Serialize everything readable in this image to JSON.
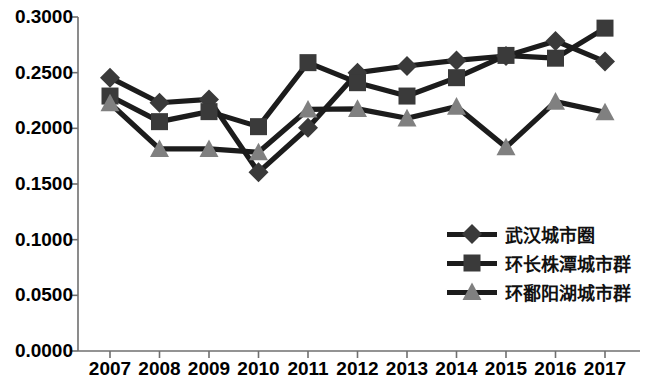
{
  "chart_data": {
    "type": "line",
    "title": "",
    "xlabel": "",
    "ylabel": "",
    "categories": [
      "2007",
      "2008",
      "2009",
      "2010",
      "2011",
      "2012",
      "2013",
      "2014",
      "2015",
      "2016",
      "2017"
    ],
    "ylim": [
      0.0,
      0.3
    ],
    "ytick_labels": [
      "0.0000",
      "0.0500",
      "0.1000",
      "0.1500",
      "0.2000",
      "0.2500",
      "0.3000"
    ],
    "ytick_values": [
      0.0,
      0.05,
      0.1,
      0.15,
      0.2,
      0.25,
      0.3
    ],
    "grid": false,
    "legend_position": "inside-right",
    "series": [
      {
        "name": "武汉城市圈",
        "marker": "diamond",
        "color": "#3a3a3a",
        "line_color": "#1c1c1c",
        "values": [
          0.2455,
          0.223,
          0.226,
          0.1605,
          0.2005,
          0.25,
          0.256,
          0.261,
          0.265,
          0.2785,
          0.26
        ]
      },
      {
        "name": "环长株潭城市群",
        "marker": "square",
        "color": "#3a3a3a",
        "line_color": "#1c1c1c",
        "values": [
          0.229,
          0.206,
          0.215,
          0.2015,
          0.259,
          0.241,
          0.229,
          0.2455,
          0.2655,
          0.263,
          0.29
        ]
      },
      {
        "name": "环鄱阳湖城市群",
        "marker": "triangle",
        "color": "#808080",
        "line_color": "#1c1c1c",
        "values": [
          0.2225,
          0.1815,
          0.1815,
          0.1785,
          0.217,
          0.2175,
          0.209,
          0.2195,
          0.183,
          0.224,
          0.2145
        ]
      }
    ]
  }
}
